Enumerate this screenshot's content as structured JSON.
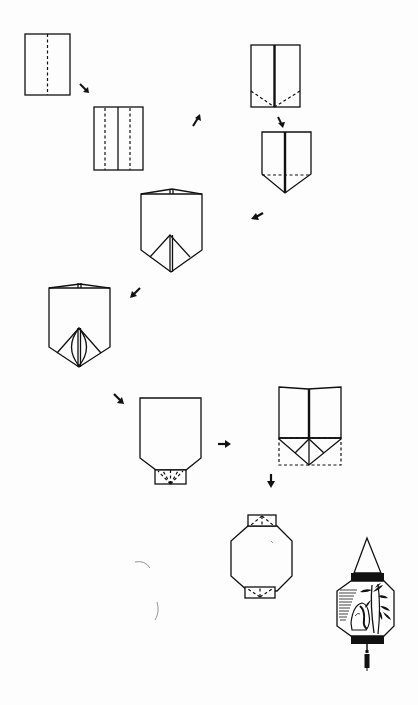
{
  "page": {
    "header_text": "",
    "background": "#fdfdfd",
    "ink_color": "#111111"
  },
  "diagram": {
    "title": "",
    "type": "origami-instructions",
    "steps": [
      {
        "id": 1,
        "description": "Rectangle with vertical center valley fold (dashed)"
      },
      {
        "id": 2,
        "description": "Edges folded to center; two dashed valley lines"
      },
      {
        "id": 3,
        "description": "Center seam with diagonal dashed folds at bottom corners"
      },
      {
        "id": 4,
        "description": "Bottom corners folded, pointed base with horizontal dashed line"
      },
      {
        "id": 5,
        "description": "Top flaps opened; triangular pocket at bottom"
      },
      {
        "id": 6,
        "description": "Inner pocket layers shown with curved lines"
      },
      {
        "id": 7,
        "description": "Shape with folded base tab (dashed fan creases)"
      },
      {
        "id": 8,
        "description": "Opened view showing dashed rectangle base and triangles"
      },
      {
        "id": 9,
        "description": "Octagonal lantern body with top and bottom tabs"
      },
      {
        "id": 10,
        "description": "Finished decorated lantern with hanger and tassel"
      }
    ],
    "arrows": [
      {
        "from": 1,
        "to": 2,
        "direction": "down-right"
      },
      {
        "from": 2,
        "to": 3,
        "direction": "up-right"
      },
      {
        "from": 3,
        "to": 4,
        "direction": "down"
      },
      {
        "from": 4,
        "to": 5,
        "direction": "down-left"
      },
      {
        "from": 5,
        "to": 6,
        "direction": "down-left"
      },
      {
        "from": 6,
        "to": 7,
        "direction": "down-right"
      },
      {
        "from": 7,
        "to": 8,
        "direction": "right"
      },
      {
        "from": 8,
        "to": 9,
        "direction": "down"
      }
    ],
    "final_decoration": "bamboo and rock ink painting"
  }
}
